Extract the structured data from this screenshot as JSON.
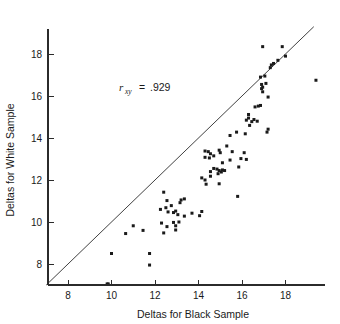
{
  "chart_data": {
    "type": "scatter",
    "title": "",
    "xlabel": "Deltas for Black Sample",
    "ylabel": "Deltas for White Sample",
    "xlim": [
      7.0,
      19.8
    ],
    "ylim": [
      7.0,
      19.2
    ],
    "xticks": [
      8,
      10,
      12,
      14,
      16,
      18
    ],
    "yticks": [
      8,
      10,
      12,
      14,
      16,
      18
    ],
    "xticklabels": [
      "8",
      "10",
      "12",
      "14",
      "16",
      "18"
    ],
    "yticklabels": [
      "8",
      "10",
      "12",
      "14",
      "16",
      "18"
    ],
    "grid": false,
    "legend": null,
    "annotations": [
      {
        "name": "correlation-annotation",
        "symbol": "r",
        "subscript": "xy",
        "equals": "=",
        "value": ".929",
        "text": "r_xy = .929",
        "x": 11.4,
        "y": 16.3
      }
    ],
    "reference_line": {
      "name": "identity-line",
      "description": "45-degree line of equality y = x",
      "from": [
        7.0,
        7.0
      ],
      "to": [
        19.3,
        19.3
      ]
    },
    "marker": {
      "shape": "square",
      "size_px": 3,
      "color": "#1a1a1a"
    },
    "n_points": 92,
    "points": [
      [
        9.8,
        7.05
      ],
      [
        9.85,
        7.05
      ],
      [
        11.75,
        7.95
      ],
      [
        10.0,
        8.5
      ],
      [
        11.75,
        8.5
      ],
      [
        10.65,
        9.45
      ],
      [
        11.45,
        9.6
      ],
      [
        12.95,
        9.62
      ],
      [
        12.4,
        9.48
      ],
      [
        12.55,
        9.78
      ],
      [
        11.0,
        9.82
      ],
      [
        12.95,
        9.82
      ],
      [
        12.3,
        9.95
      ],
      [
        12.85,
        9.98
      ],
      [
        13.1,
        10.0
      ],
      [
        13.35,
        10.28
      ],
      [
        14.05,
        10.3
      ],
      [
        13.7,
        10.42
      ],
      [
        12.6,
        10.48
      ],
      [
        14.15,
        10.5
      ],
      [
        12.95,
        10.52
      ],
      [
        12.5,
        10.68
      ],
      [
        12.75,
        10.78
      ],
      [
        13.15,
        10.92
      ],
      [
        12.55,
        11.02
      ],
      [
        13.2,
        11.05
      ],
      [
        13.35,
        11.1
      ],
      [
        12.4,
        11.42
      ],
      [
        15.8,
        11.22
      ],
      [
        14.35,
        11.8
      ],
      [
        14.95,
        11.82
      ],
      [
        14.3,
        12.0
      ],
      [
        14.15,
        12.1
      ],
      [
        14.55,
        12.18
      ],
      [
        14.9,
        12.3
      ],
      [
        15.05,
        12.38
      ],
      [
        14.95,
        12.45
      ],
      [
        15.1,
        12.48
      ],
      [
        14.7,
        12.55
      ],
      [
        15.85,
        12.62
      ],
      [
        15.1,
        12.82
      ],
      [
        15.45,
        12.95
      ],
      [
        16.2,
        12.98
      ],
      [
        14.3,
        13.08
      ],
      [
        14.7,
        13.15
      ],
      [
        14.55,
        13.25
      ],
      [
        15.0,
        13.3
      ],
      [
        14.45,
        13.35
      ],
      [
        15.55,
        13.35
      ],
      [
        14.3,
        13.38
      ],
      [
        14.95,
        13.42
      ],
      [
        15.3,
        13.62
      ],
      [
        15.45,
        14.12
      ],
      [
        16.15,
        14.2
      ],
      [
        15.75,
        14.28
      ],
      [
        17.15,
        14.28
      ],
      [
        17.2,
        14.42
      ],
      [
        16.35,
        14.6
      ],
      [
        16.45,
        14.78
      ],
      [
        16.7,
        14.8
      ],
      [
        16.2,
        14.85
      ],
      [
        16.55,
        14.88
      ],
      [
        16.3,
        14.95
      ],
      [
        16.3,
        15.12
      ],
      [
        16.6,
        15.48
      ],
      [
        16.75,
        15.52
      ],
      [
        16.85,
        15.55
      ],
      [
        17.2,
        15.95
      ],
      [
        16.95,
        16.2
      ],
      [
        16.9,
        16.35
      ],
      [
        16.95,
        16.42
      ],
      [
        16.9,
        16.55
      ],
      [
        19.4,
        16.75
      ],
      [
        16.85,
        16.9
      ],
      [
        17.05,
        16.95
      ],
      [
        17.3,
        17.35
      ],
      [
        17.35,
        17.48
      ],
      [
        17.45,
        17.55
      ],
      [
        17.65,
        17.7
      ],
      [
        18.0,
        17.9
      ],
      [
        16.95,
        18.35
      ],
      [
        17.85,
        18.35
      ],
      [
        15.95,
        13.02
      ],
      [
        16.1,
        13.3
      ],
      [
        14.55,
        12.4
      ],
      [
        15.2,
        12.45
      ],
      [
        14.85,
        12.52
      ],
      [
        13.05,
        10.35
      ],
      [
        12.85,
        10.45
      ],
      [
        12.25,
        10.6
      ],
      [
        14.5,
        13.05
      ],
      [
        17.1,
        16.6
      ]
    ]
  },
  "figure": {
    "background": "#ffffff",
    "foreground": "#1a1a1a"
  }
}
